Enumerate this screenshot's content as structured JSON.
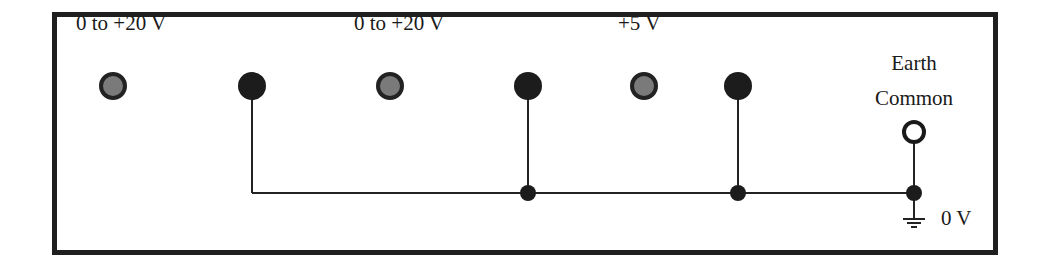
{
  "diagram": {
    "colors": {
      "frame": "#1f1f1f",
      "wire": "#222222",
      "terminal_output_fill": "#7a7a7a",
      "terminal_output_ring": "#222222",
      "terminal_return_fill": "#1c1c1c",
      "earth_ring": "#1a1a1a"
    },
    "outputs": [
      {
        "label": "0 to +20 V",
        "positive_terminal": "grey",
        "return_terminal": "black"
      },
      {
        "label": "0 to +20 V",
        "positive_terminal": "grey",
        "return_terminal": "black"
      },
      {
        "label": "+5 V",
        "positive_terminal": "grey",
        "return_terminal": "black"
      }
    ],
    "earth": {
      "label_line1": "Earth",
      "label_line2": "Common",
      "terminal": "open-ring"
    },
    "ground": {
      "label": "0 V",
      "symbol": "ground-symbol"
    },
    "connections": "All return (black) terminals tied to common bus connected to Earth Common at 0 V"
  }
}
